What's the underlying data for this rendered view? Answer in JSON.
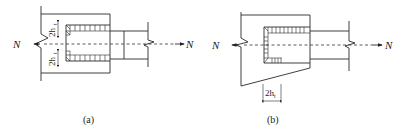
{
  "figure": {
    "panel_a": {
      "caption": "(a)",
      "force_left": "N",
      "force_right": "N",
      "dim_top": "2h",
      "dim_top_sub": "t",
      "dim_bottom": "2h",
      "dim_bottom_sub": "t"
    },
    "panel_b": {
      "caption": "(b)",
      "force_left": "N",
      "force_right": "N",
      "dim": "2h",
      "dim_sub": "t"
    }
  }
}
